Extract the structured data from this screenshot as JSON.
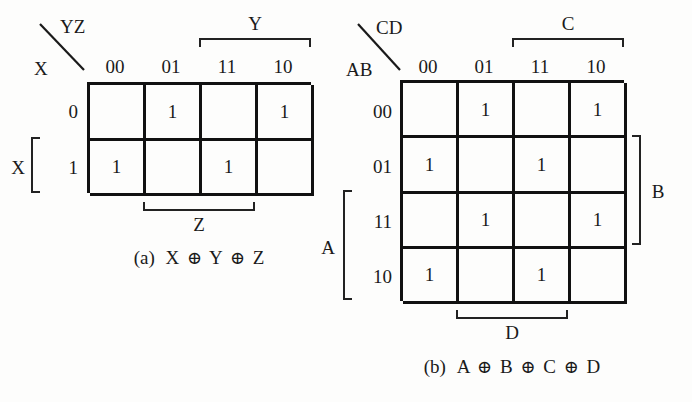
{
  "figure": {
    "background_color": "#fdfdfc",
    "ink_color": "#1a1a1a"
  },
  "maps": [
    {
      "id": "kmap-a",
      "corner": {
        "top_variables": "YZ",
        "side_variables": "X",
        "slash_icon": "diagonal-slash-icon"
      },
      "column_headers": [
        "00",
        "01",
        "11",
        "10"
      ],
      "row_headers": [
        "0",
        "1"
      ],
      "cells": [
        [
          "",
          "1",
          "",
          "1"
        ],
        [
          "1",
          "",
          "1",
          ""
        ]
      ],
      "group_brackets": [
        {
          "name": "Y",
          "label": "Y",
          "position": "top",
          "spans": "columns 11,10"
        },
        {
          "name": "X",
          "label": "X",
          "position": "left",
          "spans": "row 1"
        },
        {
          "name": "Z",
          "label": "Z",
          "position": "bottom",
          "spans": "columns 01,11"
        }
      ],
      "caption": {
        "prefix": "(a)",
        "terms": [
          "X",
          "Y",
          "Z"
        ],
        "operator": "⊕",
        "full_text": "(a) X ⊕ Y ⊕ Z"
      }
    },
    {
      "id": "kmap-b",
      "corner": {
        "top_variables": "CD",
        "side_variables": "AB",
        "slash_icon": "diagonal-slash-icon"
      },
      "column_headers": [
        "00",
        "01",
        "11",
        "10"
      ],
      "row_headers": [
        "00",
        "01",
        "11",
        "10"
      ],
      "cells": [
        [
          "",
          "1",
          "",
          "1"
        ],
        [
          "1",
          "",
          "1",
          ""
        ],
        [
          "",
          "1",
          "",
          "1"
        ],
        [
          "1",
          "",
          "1",
          ""
        ]
      ],
      "group_brackets": [
        {
          "name": "C",
          "label": "C",
          "position": "top",
          "spans": "columns 11,10"
        },
        {
          "name": "B",
          "label": "B",
          "position": "right",
          "spans": "rows 01,11"
        },
        {
          "name": "A",
          "label": "A",
          "position": "left",
          "spans": "rows 11,10"
        },
        {
          "name": "D",
          "label": "D",
          "position": "bottom",
          "spans": "columns 01,11"
        }
      ],
      "caption": {
        "prefix": "(b)",
        "terms": [
          "A",
          "B",
          "C",
          "D"
        ],
        "operator": "⊕",
        "full_text": "(b) A ⊕ B ⊕ C ⊕ D"
      }
    }
  ]
}
